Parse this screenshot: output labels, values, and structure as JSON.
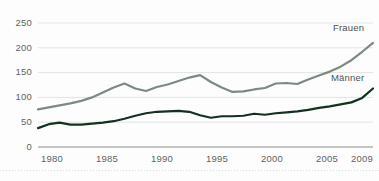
{
  "chart_data": {
    "type": "line",
    "title": "",
    "subtitle": "",
    "xlabel": "",
    "ylabel": "",
    "xlim": [
      1978,
      2009
    ],
    "ylim": [
      0,
      250
    ],
    "grid": true,
    "grid_axis": "y",
    "legend_position": "inline-right",
    "y_ticks": [
      0,
      50,
      100,
      150,
      200,
      250
    ],
    "y_tick_labels": [
      "0",
      "50",
      "100",
      "150",
      "200",
      "250"
    ],
    "x_ticks": [
      1980,
      1985,
      1990,
      1995,
      2000,
      2005,
      2009
    ],
    "x_tick_labels": [
      "1980",
      "1985",
      "1990",
      "1995",
      "2000",
      "2005",
      "2009"
    ],
    "x": [
      1978,
      1979,
      1980,
      1981,
      1982,
      1983,
      1984,
      1985,
      1986,
      1987,
      1988,
      1989,
      1990,
      1991,
      1992,
      1993,
      1994,
      1995,
      1996,
      1997,
      1998,
      1999,
      2000,
      2001,
      2002,
      2003,
      2004,
      2005,
      2006,
      2007,
      2008,
      2009
    ],
    "series": [
      {
        "name": "Frauen",
        "color": "#7d8a82",
        "values": [
          76,
          80,
          84,
          88,
          93,
          100,
          110,
          120,
          128,
          118,
          113,
          121,
          126,
          133,
          140,
          145,
          131,
          120,
          111,
          112,
          116,
          119,
          128,
          129,
          127,
          136,
          144,
          152,
          162,
          175,
          192,
          210
        ]
      },
      {
        "name": "Männer",
        "color": "#14301f",
        "values": [
          38,
          46,
          49,
          45,
          45,
          47,
          49,
          52,
          57,
          63,
          68,
          71,
          72,
          73,
          71,
          64,
          59,
          62,
          62,
          63,
          67,
          65,
          68,
          70,
          72,
          75,
          79,
          82,
          86,
          90,
          99,
          118
        ]
      }
    ],
    "annotations": [
      {
        "text": "Frauen",
        "x": 2005,
        "y": 222,
        "series": "Frauen"
      },
      {
        "text": "Männer",
        "x": 2004,
        "y": 137,
        "series": "Männer"
      }
    ]
  },
  "axes": {
    "y_labels": [
      "250",
      "200",
      "150",
      "100",
      "50",
      "0"
    ],
    "x_labels": [
      "1980",
      "1985",
      "1990",
      "1995",
      "2000",
      "2005",
      "2009"
    ]
  },
  "legend": {
    "frauen": "Frauen",
    "maenner": "Männer"
  },
  "colors": {
    "frauen_line": "#7d8a82",
    "maenner_line": "#14301f",
    "grid": "#e2e4e3",
    "axis": "#8c908e",
    "tick_text": "#5f6360",
    "background": "#fdfdfd"
  }
}
